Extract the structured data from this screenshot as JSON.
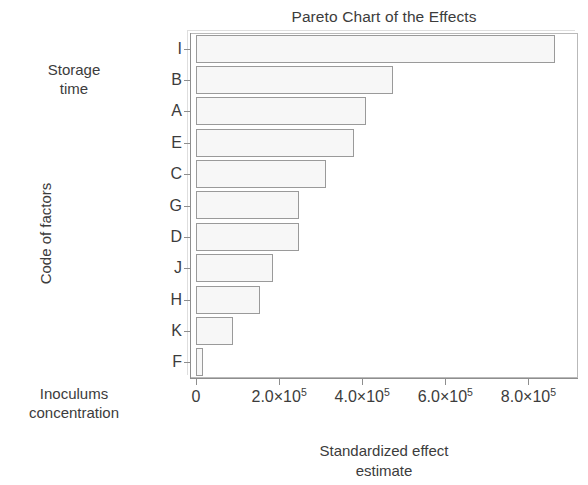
{
  "chart_data": {
    "type": "bar",
    "orientation": "horizontal",
    "title": "Pareto Chart of the Effects",
    "xlabel_lines": [
      "Standardized effect",
      "estimate"
    ],
    "ylabel": "Code of factors",
    "categories": [
      "I",
      "B",
      "A",
      "E",
      "C",
      "G",
      "D",
      "J",
      "H",
      "K",
      "F"
    ],
    "values": [
      865000,
      474000,
      409000,
      381000,
      314000,
      247000,
      247000,
      186000,
      153000,
      88000,
      16000
    ],
    "xlim": [
      0,
      900000
    ],
    "ylim_note": "categorical, ordered descending by effect magnitude",
    "xticks": [
      0,
      200000,
      400000,
      600000,
      800000
    ],
    "xtick_labels": [
      "0",
      "2.0×10",
      "4.0×10",
      "6.0×10",
      "8.0×10"
    ],
    "xtick_exponent": "5",
    "grid": false,
    "legend": false,
    "bar_fill": "#f7f7f7",
    "bar_border": "#9a9a9a",
    "annotations": [
      {
        "id": "storage-time",
        "lines": [
          "Storage",
          "time"
        ],
        "position": "left of top categories"
      },
      {
        "id": "inoculums-concentration",
        "lines": [
          "Inoculums",
          "concentration"
        ],
        "position": "left of bottom categories"
      }
    ]
  },
  "axis": {
    "x_title_lines": [
      "Standardized effect",
      "estimate"
    ],
    "y_title": "Code of factors"
  },
  "annotations": {
    "top": {
      "line1": "Storage",
      "line2": "time"
    },
    "bottom": {
      "line1": "Inoculums",
      "line2": "concentration"
    }
  },
  "colors": {
    "text": "#3c3c3c",
    "axis": "#8e8e8e",
    "bar_fill": "#f7f7f7",
    "bar_border": "#9a9a9a",
    "frame": "#b9b9b9",
    "background": "#ffffff"
  }
}
